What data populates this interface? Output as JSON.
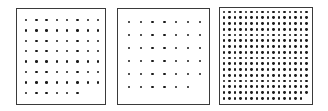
{
  "figure": {
    "panels": [
      {
        "id": "panel-1",
        "box": {
          "x": 16,
          "y": 8,
          "w": 90,
          "h": 97
        },
        "grid": {
          "cols": 8,
          "rows": 8,
          "last_row_count": 6,
          "first_x": 26,
          "first_y": 20,
          "dx": 10.3,
          "dy": 10.4,
          "dot_size": 2.6
        }
      },
      {
        "id": "panel-2",
        "box": {
          "x": 117,
          "y": 8,
          "w": 93,
          "h": 97
        },
        "grid": {
          "cols": 7,
          "rows": 6,
          "last_row_count": 6,
          "first_x": 129,
          "first_y": 22,
          "dx": 11.8,
          "dy": 13.0,
          "dot_size": 2.6
        }
      },
      {
        "id": "panel-3",
        "box": {
          "x": 219,
          "y": 7,
          "w": 94,
          "h": 98
        },
        "grid": {
          "cols": 16,
          "rows": 16,
          "last_row_count": 15,
          "first_x": 224,
          "first_y": 12,
          "dx": 5.5,
          "dy": 5.75,
          "dot_size": 2.8
        }
      }
    ],
    "colors": {
      "border": "#3a3a3a",
      "dot": "#1a1a1a",
      "background": "#ffffff"
    }
  }
}
